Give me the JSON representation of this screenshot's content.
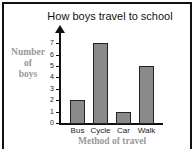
{
  "chart_data": {
    "type": "bar",
    "title": "How boys travel to school",
    "categories": [
      "Bus",
      "Cycle",
      "Car",
      "Walk"
    ],
    "values": [
      2,
      7,
      1,
      5
    ],
    "xlabel": "Method of travel",
    "ylabel": "Number of boys",
    "ylim": [
      0,
      7
    ],
    "yticks": [
      0,
      1,
      2,
      3,
      4,
      5,
      6,
      7
    ],
    "grid": false,
    "legend": null,
    "colors": {
      "bar": "#8a8a8a",
      "bar_border": "#222222",
      "axis_label": "#999999"
    }
  },
  "ylabel_lines": [
    "Number",
    "of",
    "boys"
  ]
}
